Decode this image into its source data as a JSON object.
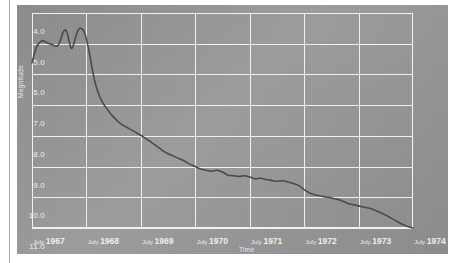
{
  "chart_data": {
    "type": "line",
    "title": "",
    "xlabel": "Time",
    "ylabel": "Magnitude",
    "grid": true,
    "legend": "none",
    "y_inverted": true,
    "ylim": [
      4.0,
      11.0
    ],
    "xlim": [
      "July 1967",
      "July 1974"
    ],
    "y_ticks": [
      "4.0",
      "5.0",
      "6.0",
      "7.0",
      "8.0",
      "9.0",
      "10.0",
      "11.0"
    ],
    "y_tick_values": [
      4.0,
      5.0,
      6.0,
      7.0,
      8.0,
      9.0,
      10.0,
      11.0
    ],
    "x_ticks": [
      {
        "month": "July",
        "year": "1967"
      },
      {
        "month": "July",
        "year": "1968"
      },
      {
        "month": "July",
        "year": "1969"
      },
      {
        "month": "July",
        "year": "1970"
      },
      {
        "month": "July",
        "year": "1971"
      },
      {
        "month": "July",
        "year": "1972"
      },
      {
        "month": "July",
        "year": "1973"
      },
      {
        "month": "July",
        "year": "1974"
      }
    ],
    "x_tick_values": [
      1967.5,
      1968.5,
      1969.5,
      1970.5,
      1971.5,
      1972.5,
      1973.5,
      1974.5
    ],
    "series": [
      {
        "name": "Magnitude",
        "color": "#4a4a4a",
        "x": [
          1967.5,
          1967.54,
          1967.58,
          1967.62,
          1967.66,
          1967.7,
          1967.74,
          1967.78,
          1967.82,
          1967.86,
          1967.9,
          1967.94,
          1967.98,
          1968.02,
          1968.06,
          1968.1,
          1968.14,
          1968.18,
          1968.22,
          1968.26,
          1968.3,
          1968.34,
          1968.38,
          1968.42,
          1968.46,
          1968.5,
          1968.56,
          1968.62,
          1968.68,
          1968.74,
          1968.8,
          1968.86,
          1968.92,
          1968.98,
          1969.06,
          1969.14,
          1969.22,
          1969.3,
          1969.4,
          1969.5,
          1969.6,
          1969.7,
          1969.8,
          1969.9,
          1970.0,
          1970.1,
          1970.2,
          1970.3,
          1970.4,
          1970.5,
          1970.6,
          1970.7,
          1970.8,
          1970.9,
          1971.0,
          1971.1,
          1971.2,
          1971.3,
          1971.4,
          1971.5,
          1971.6,
          1971.7,
          1971.8,
          1971.9,
          1972.0,
          1972.1,
          1972.2,
          1972.3,
          1972.4,
          1972.5,
          1972.6,
          1972.7,
          1972.8,
          1972.9,
          1973.0,
          1973.1,
          1973.2,
          1973.3,
          1973.4,
          1973.5,
          1973.6,
          1973.7,
          1973.8,
          1973.9,
          1974.0,
          1974.1,
          1974.2,
          1974.3,
          1974.4,
          1974.5
        ],
        "y": [
          5.62,
          5.35,
          5.12,
          5.0,
          4.93,
          4.9,
          4.93,
          4.97,
          5.0,
          5.02,
          5.05,
          5.08,
          5.05,
          4.9,
          4.68,
          4.55,
          4.62,
          4.9,
          5.15,
          5.05,
          4.8,
          4.58,
          4.5,
          4.52,
          4.62,
          4.85,
          5.35,
          5.95,
          6.4,
          6.7,
          6.92,
          7.08,
          7.22,
          7.35,
          7.5,
          7.62,
          7.7,
          7.78,
          7.88,
          7.98,
          8.1,
          8.22,
          8.35,
          8.48,
          8.58,
          8.66,
          8.74,
          8.82,
          8.92,
          9.0,
          9.08,
          9.12,
          9.15,
          9.12,
          9.18,
          9.28,
          9.3,
          9.32,
          9.3,
          9.34,
          9.4,
          9.38,
          9.42,
          9.45,
          9.48,
          9.46,
          9.5,
          9.55,
          9.62,
          9.75,
          9.86,
          9.92,
          9.96,
          9.99,
          10.02,
          10.06,
          10.12,
          10.2,
          10.24,
          10.28,
          10.32,
          10.36,
          10.42,
          10.5,
          10.58,
          10.68,
          10.78,
          10.88,
          10.95,
          11.0
        ]
      }
    ]
  }
}
